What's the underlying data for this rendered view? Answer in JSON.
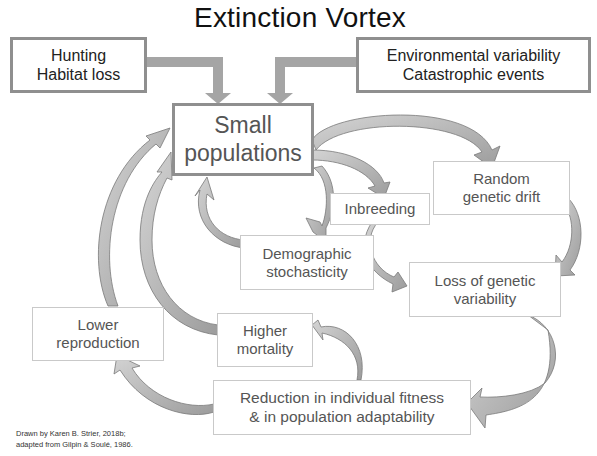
{
  "title": "Extinction Vortex",
  "colors": {
    "arrow_fill": "#bdbdbd",
    "arrow_stroke": "#7a7a7a",
    "thick_border": "#8f8f8f",
    "thin_border": "#c9c9c9",
    "text": "#3a3a3a"
  },
  "nodes": {
    "hunting": {
      "line1": "Hunting",
      "line2": "Habitat loss"
    },
    "environmental": {
      "line1": "Environmental variability",
      "line2": "Catastrophic events"
    },
    "small_populations": {
      "line1": "Small",
      "line2": "populations"
    },
    "inbreeding": {
      "line1": "Inbreeding"
    },
    "random_drift": {
      "line1": "Random",
      "line2": "genetic drift"
    },
    "demographic": {
      "line1": "Demographic",
      "line2": "stochasticity"
    },
    "loss_genetic": {
      "line1": "Loss of genetic",
      "line2": "variability"
    },
    "lower_reproduction": {
      "line1": "Lower",
      "line2": "reproduction"
    },
    "higher_mortality": {
      "line1": "Higher",
      "line2": "mortality"
    },
    "reduction_fitness": {
      "line1": "Reduction in individual fitness",
      "line2": "& in population adaptability"
    }
  },
  "edges": [
    {
      "from": "Hunting / Habitat loss",
      "to": "Small populations"
    },
    {
      "from": "Environmental variability / Catastrophic events",
      "to": "Small populations"
    },
    {
      "from": "Small populations",
      "to": "Random genetic drift"
    },
    {
      "from": "Small populations",
      "to": "Inbreeding"
    },
    {
      "from": "Small populations",
      "to": "Demographic stochasticity"
    },
    {
      "from": "Demographic stochasticity",
      "to": "Small populations"
    },
    {
      "from": "Inbreeding",
      "to": "Loss of genetic variability"
    },
    {
      "from": "Random genetic drift",
      "to": "Loss of genetic variability"
    },
    {
      "from": "Loss of genetic variability",
      "to": "Reduction in individual fitness & in population adaptability"
    },
    {
      "from": "Reduction in individual fitness & in population adaptability",
      "to": "Higher mortality"
    },
    {
      "from": "Reduction in individual fitness & in population adaptability",
      "to": "Lower reproduction"
    },
    {
      "from": "Higher mortality",
      "to": "Small populations"
    },
    {
      "from": "Lower reproduction",
      "to": "Small populations"
    }
  ],
  "credit": {
    "line1": "Drawn by Karen B. Strier, 2018b;",
    "line2": "adapted from Gilpin & Soulé, 1986."
  }
}
